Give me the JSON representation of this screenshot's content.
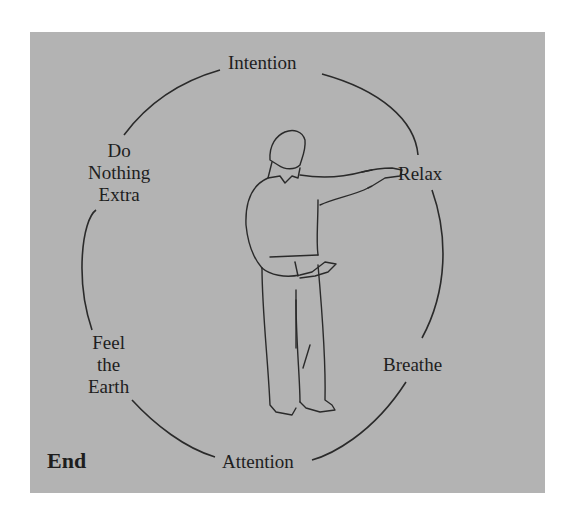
{
  "diagram": {
    "background": "#b3b3b3",
    "line_color": "#2a2a2a",
    "center_figure": "standing-person-one-arm-extended",
    "labels": {
      "top": "Intention",
      "upper_right": "Relax",
      "lower_right": "Breathe",
      "bottom": "Attention",
      "lower_left": [
        "Feel",
        "the",
        "Earth"
      ],
      "upper_left": [
        "Do",
        "Nothing",
        "Extra"
      ],
      "corner": "End"
    }
  }
}
